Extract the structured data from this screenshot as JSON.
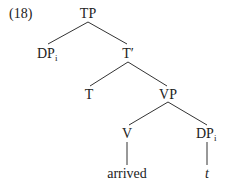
{
  "example_number": "(18)",
  "nodes": {
    "tp": {
      "label": "TP"
    },
    "dp_spec": {
      "label": "DP",
      "subscript": "i"
    },
    "t_bar": {
      "label": "T′"
    },
    "t_head": {
      "label": "T"
    },
    "vp": {
      "label": "VP"
    },
    "v": {
      "label": "V"
    },
    "dp_obj": {
      "label": "DP",
      "subscript": "i"
    },
    "arrived": {
      "label": "arrived"
    },
    "trace": {
      "label": "t"
    }
  },
  "colors": {
    "text": "#222222",
    "lines": "#333333",
    "background": "#ffffff"
  }
}
